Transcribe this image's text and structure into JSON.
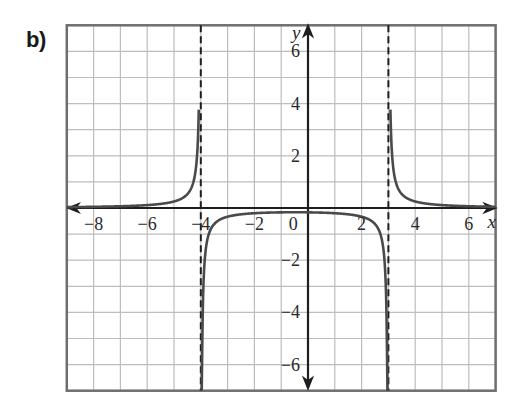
{
  "label": "b)",
  "chart_data": {
    "type": "line",
    "title": "",
    "part_label": "b)",
    "xlabel": "x",
    "ylabel": "y",
    "xlim": [
      -9,
      7
    ],
    "ylim": [
      -7,
      7
    ],
    "grid": true,
    "grid_step": 1,
    "x_ticks": [
      {
        "value": -8,
        "label": "−8"
      },
      {
        "value": -6,
        "label": "−6"
      },
      {
        "value": -4,
        "label": "−4"
      },
      {
        "value": -2,
        "label": "−2"
      },
      {
        "value": 0,
        "label": "0"
      },
      {
        "value": 2,
        "label": "2"
      },
      {
        "value": 4,
        "label": "4"
      },
      {
        "value": 6,
        "label": "6"
      }
    ],
    "y_ticks": [
      {
        "value": 6,
        "label": "6"
      },
      {
        "value": 4,
        "label": "4"
      },
      {
        "value": 2,
        "label": "2"
      },
      {
        "value": -2,
        "label": "−2"
      },
      {
        "value": -4,
        "label": "−4"
      },
      {
        "value": -6,
        "label": "−6"
      }
    ],
    "vertical_asymptotes": [
      -4,
      3
    ],
    "horizontal_asymptote": 0,
    "function": "y = 2/((x+4)(x-3))",
    "series": [
      {
        "name": "left branch",
        "x": [
          -9,
          -8,
          -7,
          -6,
          -5,
          -4.5,
          -4.3,
          -4.15,
          -4.08
        ],
        "y": [
          0.033,
          0.045,
          0.067,
          0.111,
          0.25,
          0.533,
          1.053,
          1.8,
          3.5
        ]
      },
      {
        "name": "middle branch",
        "x": [
          -3.97,
          -3.9,
          -3.5,
          -3,
          -2,
          -1,
          -0.5,
          0,
          1,
          2,
          2.5,
          2.9,
          2.97
        ],
        "y": [
          -6.9,
          -2.9,
          -0.615,
          -0.333,
          -0.2,
          -0.167,
          -0.163,
          -0.167,
          -0.2,
          -0.333,
          -0.615,
          -2.9,
          -6.9
        ]
      },
      {
        "name": "right branch",
        "x": [
          3.08,
          3.15,
          3.3,
          3.5,
          4,
          5,
          6,
          7
        ],
        "y": [
          3.5,
          1.8,
          0.915,
          0.533,
          0.25,
          0.111,
          0.067,
          0.045
        ]
      }
    ]
  },
  "colors": {
    "grid": "#bdbdbd",
    "frame": "#6e6e6e",
    "axis": "#1e1e1e",
    "curve": "#4a4a4a",
    "asymptote": "#1e1e1e"
  }
}
